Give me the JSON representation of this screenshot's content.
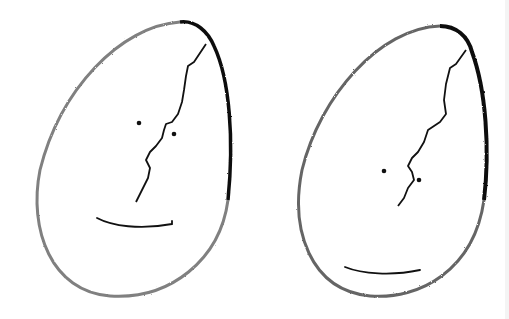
{
  "scene": {
    "description": "Hand-drawn pencil sketch of two cracked eggs with simple faces",
    "background": "#ffffff",
    "ink": "#111111",
    "eggs": [
      {
        "name": "left-egg",
        "face": {
          "eyes": 2,
          "mouth": "slight smile",
          "mouth_position": "lower-middle"
        },
        "crack": "jagged line from top-right down to center"
      },
      {
        "name": "right-egg",
        "face": {
          "eyes": 2,
          "mouth": "slight smile",
          "mouth_position": "near bottom"
        },
        "crack": "jagged line from top-right down to center"
      }
    ]
  }
}
